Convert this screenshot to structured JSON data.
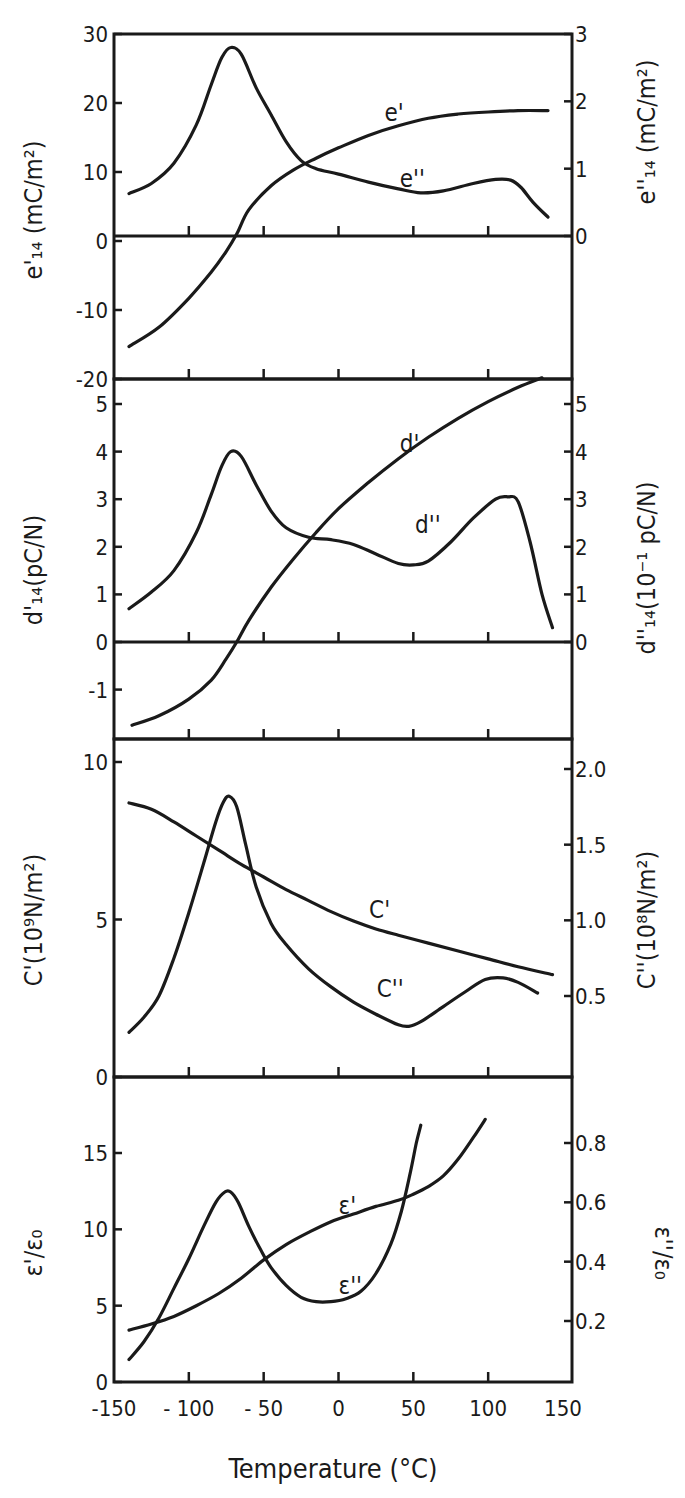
{
  "figure": {
    "xlabel": "Temperature (°C)",
    "x_ticks": [
      -150,
      -100,
      -50,
      0,
      50,
      100,
      150
    ],
    "x_tick_labels": [
      "-150",
      "- 100",
      "- 50",
      "0",
      "50",
      "100",
      "150"
    ],
    "xlim": [
      -150,
      150
    ]
  },
  "chart_data": [
    {
      "type": "line",
      "panel": "e14",
      "xlabel": "Temperature (°C)",
      "ylabel_left": "e'14 (mC/m²)",
      "ylabel_right": "e''14 (mC/m²)",
      "ylim_left": [
        -20,
        30
      ],
      "ylim_right": [
        0,
        3
      ],
      "yticks_left": [
        30,
        20,
        10,
        0,
        -10,
        -20
      ],
      "yticks_right": [
        3,
        2,
        1,
        0
      ],
      "zero_line": true,
      "series": [
        {
          "name": "e'",
          "axis": "left",
          "x": [
            -140,
            -120,
            -100,
            -85,
            -75,
            -68,
            -60,
            -45,
            -30,
            -15,
            0,
            20,
            40,
            60,
            80,
            100,
            120,
            140
          ],
          "values": [
            -15.3,
            -12.5,
            -8.3,
            -4.5,
            -1.5,
            1.0,
            4.5,
            8.0,
            10.3,
            12.0,
            13.5,
            15.3,
            16.7,
            17.8,
            18.4,
            18.7,
            18.9,
            18.9
          ]
        },
        {
          "name": "e''",
          "axis": "right",
          "x": [
            -140,
            -125,
            -110,
            -95,
            -85,
            -78,
            -72,
            -65,
            -55,
            -45,
            -35,
            -25,
            -15,
            0,
            20,
            40,
            55,
            70,
            90,
            105,
            115,
            122,
            130,
            140
          ],
          "values": [
            0.63,
            0.78,
            1.08,
            1.65,
            2.25,
            2.65,
            2.8,
            2.7,
            2.2,
            1.8,
            1.4,
            1.12,
            1.0,
            0.92,
            0.8,
            0.7,
            0.64,
            0.67,
            0.78,
            0.84,
            0.83,
            0.72,
            0.5,
            0.28
          ]
        }
      ],
      "annotations": [
        {
          "text": "e'",
          "x": 30,
          "y_left": 18.5
        },
        {
          "text": "e''",
          "x": 40,
          "y_left": 9.0
        }
      ]
    },
    {
      "type": "line",
      "panel": "d14",
      "ylabel_left": "d'14 (pC/N)",
      "ylabel_right": "d''14 (10⁻¹ pC/N)",
      "ylim_left": [
        -2,
        5.5
      ],
      "ylim_right": [
        -2,
        5.5
      ],
      "yticks_left": [
        5,
        4,
        3,
        2,
        1,
        0,
        -1
      ],
      "yticks_right": [
        5,
        4,
        3,
        2,
        1,
        0
      ],
      "zero_line": true,
      "series": [
        {
          "name": "d'",
          "axis": "left",
          "x": [
            -138,
            -120,
            -100,
            -85,
            -75,
            -68,
            -60,
            -45,
            -30,
            -15,
            0,
            20,
            40,
            60,
            80,
            100,
            120,
            136
          ],
          "values": [
            -1.75,
            -1.55,
            -1.2,
            -0.8,
            -0.35,
            0.0,
            0.45,
            1.15,
            1.75,
            2.3,
            2.8,
            3.35,
            3.85,
            4.3,
            4.7,
            5.05,
            5.35,
            5.55
          ]
        },
        {
          "name": "d''",
          "axis": "right",
          "x": [
            -140,
            -125,
            -110,
            -95,
            -85,
            -78,
            -72,
            -65,
            -55,
            -45,
            -35,
            -20,
            -5,
            10,
            25,
            40,
            50,
            60,
            75,
            90,
            105,
            113,
            120,
            128,
            136,
            143
          ],
          "values": [
            0.7,
            1.05,
            1.5,
            2.3,
            3.1,
            3.7,
            4.0,
            3.9,
            3.3,
            2.75,
            2.4,
            2.2,
            2.15,
            2.05,
            1.85,
            1.65,
            1.62,
            1.7,
            2.1,
            2.6,
            3.0,
            3.05,
            2.95,
            2.1,
            1.0,
            0.3
          ]
        }
      ],
      "annotations": [
        {
          "text": "d'",
          "x": 40,
          "y_left": 4.15
        },
        {
          "text": "d''",
          "x": 50,
          "y_left": 2.45
        }
      ]
    },
    {
      "type": "line",
      "panel": "C",
      "ylabel_left": "C' (10⁹ N/m²)",
      "ylabel_right": "C'' (10⁸ N/m²)",
      "ylim_left": [
        0,
        10.5
      ],
      "ylim_right": [
        0,
        2.1
      ],
      "yticks_left": [
        10,
        5,
        0
      ],
      "yticks_right": [
        2.0,
        1.5,
        1.0,
        0.5
      ],
      "series": [
        {
          "name": "C'",
          "axis": "left",
          "x": [
            -140,
            -125,
            -110,
            -95,
            -80,
            -65,
            -50,
            -35,
            -20,
            -5,
            10,
            25,
            40,
            60,
            80,
            100,
            120,
            143
          ],
          "values": [
            8.7,
            8.5,
            8.1,
            7.65,
            7.2,
            6.75,
            6.35,
            5.95,
            5.6,
            5.25,
            4.95,
            4.7,
            4.5,
            4.25,
            4.0,
            3.75,
            3.5,
            3.25
          ]
        },
        {
          "name": "C''",
          "axis": "right",
          "x": [
            -140,
            -130,
            -120,
            -110,
            -100,
            -90,
            -82,
            -77,
            -73,
            -68,
            -62,
            -55,
            -45,
            -35,
            -20,
            -5,
            10,
            25,
            40,
            47,
            55,
            70,
            85,
            98,
            110,
            120,
            133
          ],
          "values": [
            0.26,
            0.36,
            0.5,
            0.75,
            1.05,
            1.38,
            1.65,
            1.78,
            1.82,
            1.75,
            1.5,
            1.22,
            0.98,
            0.84,
            0.68,
            0.56,
            0.46,
            0.38,
            0.31,
            0.3,
            0.33,
            0.43,
            0.53,
            0.61,
            0.62,
            0.59,
            0.52
          ]
        }
      ],
      "annotations": [
        {
          "text": "C'",
          "x": 20,
          "y_left": 5.3
        },
        {
          "text": "C''",
          "x": 25,
          "y_left": 2.8
        }
      ]
    },
    {
      "type": "line",
      "panel": "epsilon",
      "xlabel": "Temperature (°C)",
      "ylabel_left": "ε'/ε₀",
      "ylabel_right": "ε''/ε₀",
      "ylim_left": [
        0,
        18.5
      ],
      "ylim_right": [
        0,
        0.92
      ],
      "yticks_left": [
        15,
        10,
        5,
        0
      ],
      "yticks_right": [
        0.8,
        0.6,
        0.4,
        0.2
      ],
      "series": [
        {
          "name": "ε'",
          "axis": "left",
          "x": [
            -140,
            -125,
            -110,
            -95,
            -80,
            -65,
            -50,
            -35,
            -20,
            -5,
            10,
            25,
            40,
            50,
            60,
            70,
            80,
            90,
            98
          ],
          "values": [
            3.4,
            3.8,
            4.3,
            5.0,
            5.8,
            6.8,
            8.0,
            9.0,
            9.8,
            10.5,
            11.0,
            11.5,
            11.9,
            12.3,
            12.8,
            13.5,
            14.6,
            16.0,
            17.2
          ]
        },
        {
          "name": "ε''",
          "axis": "right",
          "x": [
            -140,
            -130,
            -120,
            -110,
            -100,
            -90,
            -82,
            -76,
            -72,
            -67,
            -60,
            -52,
            -45,
            -35,
            -25,
            -15,
            -5,
            5,
            15,
            25,
            35,
            42,
            48,
            52,
            55
          ],
          "values": [
            0.07,
            0.13,
            0.21,
            0.31,
            0.41,
            0.52,
            0.6,
            0.635,
            0.635,
            0.6,
            0.52,
            0.44,
            0.38,
            0.32,
            0.28,
            0.265,
            0.265,
            0.275,
            0.3,
            0.36,
            0.46,
            0.57,
            0.7,
            0.8,
            0.86
          ]
        }
      ],
      "annotations": [
        {
          "text": "ε'",
          "x": 0,
          "y_left": 11.5
        },
        {
          "text": "ε''",
          "x": 0,
          "y_left": 6.3
        }
      ]
    }
  ],
  "labels": {
    "e_left_title": "e'₁₄ (mC/m²)",
    "e_right_title": "e''₁₄ (mC/m²)",
    "d_left_title": "d'₁₄(pC/N)",
    "d_right_title": "d''₁₄(10⁻¹ pC/N)",
    "c_left_title": "C'(10⁹N/m²)",
    "c_right_title": "C''(10⁸N/m²)",
    "eps_left_title": "ε'/ε₀",
    "eps_right_title": "ε''/ε₀",
    "x_title": "Temperature (°C)",
    "e_ticks_left": [
      "30",
      "20",
      "10",
      "0",
      "-10",
      "-20"
    ],
    "e_ticks_right": [
      "3",
      "2",
      "1",
      "0"
    ],
    "d_ticks_left": [
      "5",
      "4",
      "3",
      "2",
      "1",
      "0",
      "-1"
    ],
    "d_ticks_right": [
      "5",
      "4",
      "3",
      "2",
      "1",
      "0"
    ],
    "c_ticks_left": [
      "10",
      "5",
      "0"
    ],
    "c_ticks_right": [
      "2.0",
      "1.5",
      "1.0",
      "0.5"
    ],
    "eps_ticks_left": [
      "15",
      "10",
      "5",
      "0"
    ],
    "eps_ticks_right": [
      "0.8",
      "0.6",
      "0.4",
      "0.2"
    ]
  }
}
